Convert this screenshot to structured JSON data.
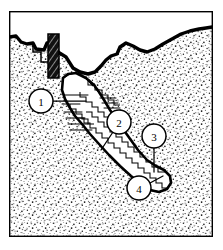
{
  "figure": {
    "style": "line-drawing",
    "colors": {
      "ink": "#000000",
      "paper": "#ffffff",
      "rock_fill": "#ffffff",
      "void_fill": "#ffffff",
      "shaft_hatch": "#1a1a1a"
    },
    "frame": {
      "x": 9,
      "y": 11,
      "width": 204,
      "height": 226,
      "stroke": "#000000",
      "stroke_width": 1.4
    }
  },
  "callouts": [
    {
      "id": "callout-1",
      "label": "1",
      "cx": 41,
      "cy": 101,
      "r": 12,
      "leader": {
        "x1": 53,
        "y1": 101,
        "x2": 86,
        "y2": 101
      }
    },
    {
      "id": "callout-2",
      "label": "2",
      "cx": 119,
      "cy": 122,
      "r": 12,
      "leader": {
        "x1": 113,
        "y1": 132,
        "x2": 101,
        "y2": 150
      }
    },
    {
      "id": "callout-3",
      "label": "3",
      "cx": 154,
      "cy": 136,
      "r": 12,
      "leader": {
        "x1": 154,
        "y1": 148,
        "x2": 154,
        "y2": 172
      }
    },
    {
      "id": "callout-4",
      "label": "4",
      "cx": 139,
      "cy": 188,
      "r": 12,
      "leader": {
        "x1": 150,
        "y1": 183,
        "x2": 163,
        "y2": 176
      }
    }
  ],
  "features": [
    {
      "name": "ground-surface-line",
      "description": "Irregular dark ground surface running across the upper part of the section"
    },
    {
      "name": "vertical-shaft",
      "description": "Dark cross-hatched vertical shaft descending from the surface at upper left"
    },
    {
      "name": "upper-chamber",
      "description": "White void chamber with stepped floor below the shaft"
    },
    {
      "name": "stairway-tunnel",
      "description": "Long stepped stairway descending diagonally to the lower right"
    },
    {
      "name": "terminus-chamber",
      "description": "Rounded end chamber at the bottom of the stairway"
    },
    {
      "name": "rock-matrix",
      "description": "Stippled bedrock fill surrounding the voids"
    }
  ]
}
